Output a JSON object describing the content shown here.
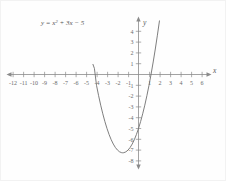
{
  "chart_data": {
    "type": "line",
    "title": "",
    "equation_label": "y = x² + 3x − 5",
    "equation_parts": {
      "prefix": "y = x",
      "exponent": "2",
      "suffix": " + 3x − 5"
    },
    "xlabel": "x",
    "ylabel": "y",
    "xlim": [
      -12.8,
      6.6
    ],
    "ylim": [
      -8.8,
      4.7
    ],
    "grid": false,
    "legend": "none",
    "x_ticks": [
      -12,
      -11,
      -10,
      -9,
      -8,
      -7,
      -6,
      -5,
      -4,
      -3,
      -2,
      -1,
      1,
      2,
      3,
      4,
      5,
      6
    ],
    "x_tick_labels": [
      "-12",
      "-11",
      "-10",
      "-9",
      "-8",
      "-7",
      "-6",
      "-5",
      "-4",
      "-3",
      "-2",
      "-1",
      "1",
      "2",
      "3",
      "4",
      "5",
      "6"
    ],
    "y_ticks": [
      4,
      3,
      2,
      1,
      -1,
      -2,
      -3,
      -4,
      -5,
      -6,
      -7,
      -8
    ],
    "y_tick_labels": [
      "4",
      "3",
      "2",
      "1",
      "-1",
      "-2",
      "-3",
      "-4",
      "-5",
      "-6",
      "-7",
      "-8"
    ],
    "series": [
      {
        "name": "y = x² + 3x − 5",
        "function": "x^2 + 3x - 5",
        "vertex": [
          -1.5,
          -7.25
        ],
        "roots": [
          -4.1926,
          1.1926
        ],
        "y_intercept": -5,
        "points": [
          [
            -4.35,
            0.97
          ],
          [
            -4.2,
            0.57
          ],
          [
            -4.0,
            -1.0
          ],
          [
            -3.8,
            -1.96
          ],
          [
            -3.6,
            -2.84
          ],
          [
            -3.4,
            -3.64
          ],
          [
            -3.2,
            -4.36
          ],
          [
            -3.0,
            -5.0
          ],
          [
            -2.8,
            -5.56
          ],
          [
            -2.6,
            -6.04
          ],
          [
            -2.4,
            -6.44
          ],
          [
            -2.2,
            -6.76
          ],
          [
            -2.0,
            -7.0
          ],
          [
            -1.8,
            -7.16
          ],
          [
            -1.6,
            -7.24
          ],
          [
            -1.5,
            -7.25
          ],
          [
            -1.4,
            -7.24
          ],
          [
            -1.2,
            -7.16
          ],
          [
            -1.0,
            -7.0
          ],
          [
            -0.8,
            -6.76
          ],
          [
            -0.6,
            -6.44
          ],
          [
            -0.4,
            -6.04
          ],
          [
            -0.2,
            -5.56
          ],
          [
            0.0,
            -5.0
          ],
          [
            0.2,
            -4.36
          ],
          [
            0.4,
            -3.64
          ],
          [
            0.6,
            -2.84
          ],
          [
            0.8,
            -1.96
          ],
          [
            1.0,
            -1.0
          ],
          [
            1.2,
            0.04
          ],
          [
            1.4,
            1.16
          ],
          [
            1.6,
            2.36
          ],
          [
            1.8,
            3.64
          ],
          [
            2.0,
            5.0
          ]
        ]
      }
    ],
    "colors": {
      "curve": "#6f6f6f",
      "axis": "#8a8a8a",
      "tick_text": "#6b6b6b",
      "background": "#fefefe",
      "border": "#f2f2f2"
    }
  }
}
